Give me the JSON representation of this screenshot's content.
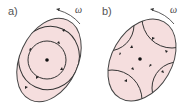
{
  "panels": [
    {
      "label": "a)",
      "omega": "ω",
      "description": "single vortex cell inside rotating ellipse, central point"
    },
    {
      "label": "b)",
      "omega": "ω",
      "description": "four corner vortex arcs with central point inside rotating ellipse"
    }
  ],
  "colors": {
    "fill": "#f5dede",
    "stroke": "#333333",
    "text": "#555555"
  }
}
